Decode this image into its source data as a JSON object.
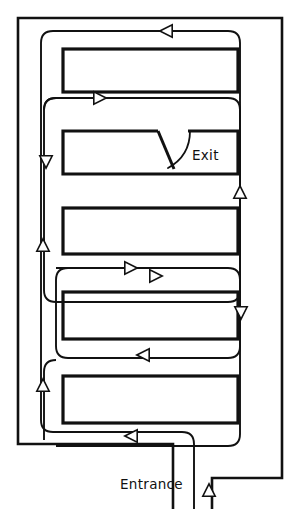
{
  "diagram": {
    "labels": {
      "exit": "Exit",
      "entrance": "Entrance"
    },
    "colors": {
      "background": "#ffffff",
      "ink": "#111111"
    },
    "canvas": {
      "width": 291,
      "height": 512
    },
    "outer_wall": {
      "name": "building-perimeter",
      "path": "M 212 509 L 212 478 L 282 478 L 282 18 L 18 18 L 18 444 L 173 444 L 173 509"
    },
    "rooms": [
      {
        "id": "room-1",
        "x": 63,
        "y": 49,
        "width": 175,
        "height": 43
      },
      {
        "id": "room-2",
        "x": 63,
        "y": 131,
        "width": 175,
        "height": 43,
        "door": true
      },
      {
        "id": "room-3",
        "x": 63,
        "y": 208,
        "width": 175,
        "height": 46
      },
      {
        "id": "room-4",
        "x": 63,
        "y": 292,
        "width": 175,
        "height": 47
      },
      {
        "id": "room-5",
        "x": 63,
        "y": 376,
        "width": 175,
        "height": 47
      }
    ],
    "door": {
      "id": "exit-door",
      "gap_start_x": 158,
      "gap_end_x": 188,
      "leaf_path": "M 158 131 L 174 169",
      "swing_path": "M 190 131 Q 190 156 168 168"
    },
    "routes": [
      {
        "id": "route-outer-return",
        "path": "M 44 110 Q 44 98 56 98 L 228 98 Q 240 98 240 110 L 240 434 Q 240 446 228 446 L 56 446"
      },
      {
        "id": "route-top-loop",
        "path": "M 53 31 L 228 31 Q 240 31 240 43 L 240 290 Q 240 302 228 302 L 56 302 Q 44 302 44 290 L 44 110 Q 44 98 56 98 L 165 98"
      },
      {
        "id": "route-left-spine",
        "path": "M 53 31 Q 41 31 41 43 L 41 420 Q 41 432 53 432 L 182 432 Q 194 432 194 444 L 194 509"
      },
      {
        "id": "route-mid-loop",
        "path": "M 56 268 L 228 268 Q 240 268 240 280 L 240 346 Q 240 358 228 358 L 68 358 Q 56 358 56 346 L 56 280 Q 56 268 68 268"
      },
      {
        "id": "route-lower-loop",
        "path": "M 56 360 Q 44 360 44 372 L 44 440"
      }
    ],
    "arrows": [
      {
        "id": "arrow-top-west",
        "x": 166,
        "y": 31,
        "dir": "left"
      },
      {
        "id": "arrow-mid-east",
        "x": 100,
        "y": 98,
        "dir": "right"
      },
      {
        "id": "arrow-left-down",
        "x": 46,
        "y": 162,
        "dir": "down"
      },
      {
        "id": "arrow-left-up",
        "x": 43,
        "y": 245,
        "dir": "up"
      },
      {
        "id": "arrow-right-up",
        "x": 240,
        "y": 192,
        "dir": "up"
      },
      {
        "id": "arrow-row3-east",
        "x": 131,
        "y": 268,
        "dir": "right"
      },
      {
        "id": "arrow-row4-east",
        "x": 156,
        "y": 276,
        "dir": "right"
      },
      {
        "id": "arrow-right-down",
        "x": 241,
        "y": 313,
        "dir": "down"
      },
      {
        "id": "arrow-row4-west",
        "x": 143,
        "y": 355,
        "dir": "left"
      },
      {
        "id": "arrow-left-up2",
        "x": 43,
        "y": 385,
        "dir": "up"
      },
      {
        "id": "arrow-row5-west",
        "x": 131,
        "y": 436,
        "dir": "left"
      },
      {
        "id": "arrow-entry-up",
        "x": 209,
        "y": 490,
        "dir": "up"
      }
    ],
    "label_positions": {
      "exit": {
        "x": 192,
        "y": 160
      },
      "entrance": {
        "x": 120,
        "y": 489
      }
    }
  }
}
